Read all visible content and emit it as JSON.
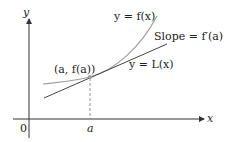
{
  "diagram": {
    "axes": {
      "x_label": "x",
      "y_label": "y",
      "origin_label": "0",
      "tick_label": "a"
    },
    "labels": {
      "curve": "y = f(x)",
      "tangent_slope": "Slope = f′(a)",
      "tangent_line": "y = L(x)",
      "point": "(a, f(a))"
    },
    "colors": {
      "axes": "#333333",
      "curve": "#9e9e9e",
      "tangent": "#444444",
      "point": "#9e9e9e",
      "dashed": "#777777"
    }
  }
}
